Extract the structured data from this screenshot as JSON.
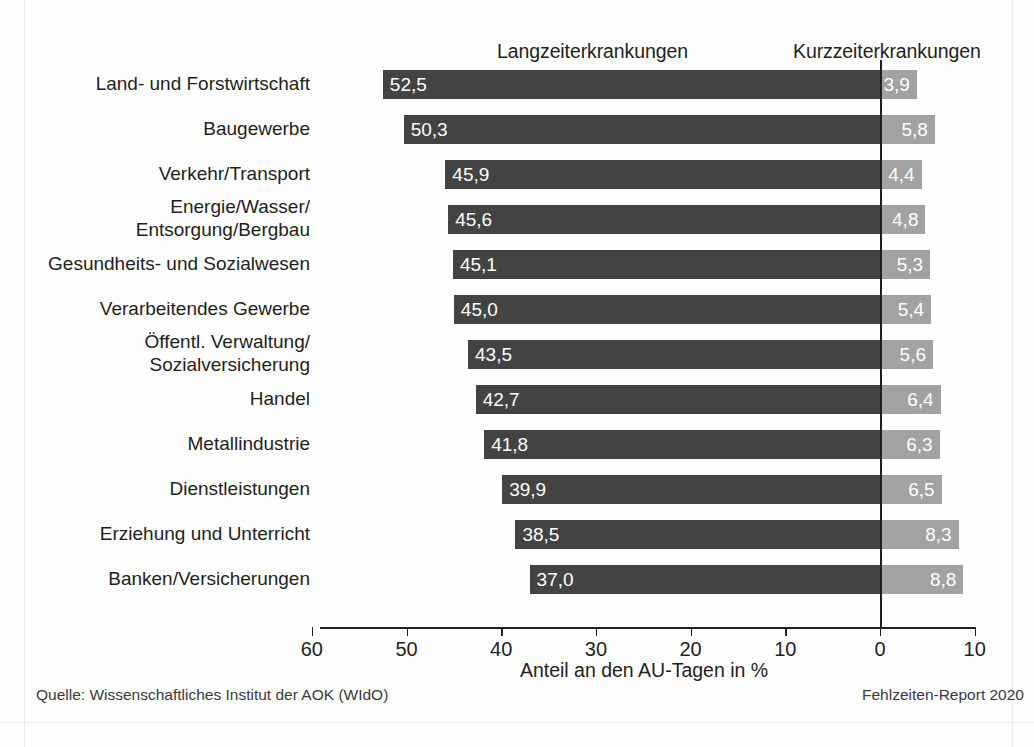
{
  "headers": {
    "long_term": "Langzeiterkrankungen",
    "short_term": "Kurzzeiterkrankungen"
  },
  "axis": {
    "title": "Anteil an den AU-Tagen in %",
    "ticks": [
      "60",
      "50",
      "40",
      "30",
      "20",
      "10",
      "0",
      "10"
    ]
  },
  "footer": {
    "source": "Quelle: Wissenschaftliches Institut der AOK (WIdO)",
    "report": "Fehlzeiten-Report 2020"
  },
  "colors": {
    "long_term_bar": "#434343",
    "short_term_bar": "#a2a2a2",
    "axis": "#231f20",
    "value_text": "#ffffff"
  },
  "chart_data": {
    "type": "bar",
    "orientation": "horizontal",
    "layout": "diverging",
    "title": "",
    "xlabel": "Anteil an den AU-Tagen in %",
    "ylabel": "",
    "xlim": [
      -60,
      10
    ],
    "xticks": [
      60,
      50,
      40,
      30,
      20,
      10,
      0,
      10
    ],
    "grid": false,
    "legend_position": "top",
    "categories": [
      "Land- und Forstwirtschaft",
      "Baugewerbe",
      "Verkehr/Transport",
      "Energie/Wasser/\nEntsorgung/Bergbau",
      "Gesundheits- und Sozialwesen",
      "Verarbeitendes Gewerbe",
      "Öffentl. Verwaltung/\nSozialversicherung",
      "Handel",
      "Metallindustrie",
      "Dienstleistungen",
      "Erziehung und Unterricht",
      "Banken/Versicherungen"
    ],
    "series": [
      {
        "name": "Langzeiterkrankungen",
        "direction": "left",
        "color": "#434343",
        "values": [
          52.5,
          50.3,
          45.9,
          45.6,
          45.1,
          45.0,
          43.5,
          42.7,
          41.8,
          39.9,
          38.5,
          37.0
        ],
        "labels": [
          "52,5",
          "50,3",
          "45,9",
          "45,6",
          "45,1",
          "45,0",
          "43,5",
          "42,7",
          "41,8",
          "39,9",
          "38,5",
          "37,0"
        ]
      },
      {
        "name": "Kurzzeiterkrankungen",
        "direction": "right",
        "color": "#a2a2a2",
        "values": [
          3.9,
          5.8,
          4.4,
          4.8,
          5.3,
          5.4,
          5.6,
          6.4,
          6.3,
          6.5,
          8.3,
          8.8
        ],
        "labels": [
          "3,9",
          "5,8",
          "4,4",
          "4,8",
          "5,3",
          "5,4",
          "5,6",
          "6,4",
          "6,3",
          "6,5",
          "8,3",
          "8,8"
        ]
      }
    ]
  }
}
